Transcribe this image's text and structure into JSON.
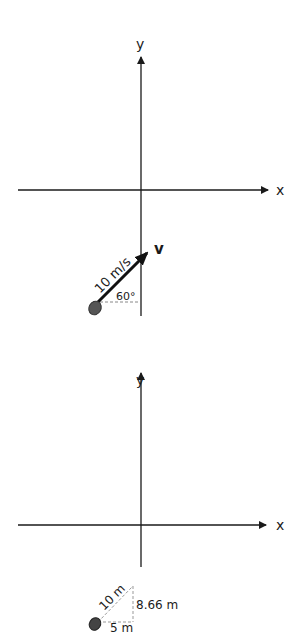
{
  "panel_top": {
    "axes": {
      "x_label": "x",
      "y_label": "y"
    },
    "vector": {
      "symbol": "v",
      "magnitude_label": "10 m/s",
      "angle_label": "60°",
      "angle_deg": 60
    },
    "object": "ball-icon"
  },
  "panel_bottom": {
    "axes": {
      "x_label": "x",
      "y_label": "y"
    },
    "displacement": {
      "hypotenuse_label": "10 m",
      "vertical_label": "8.66 m",
      "horizontal_label": "5 m"
    },
    "object": "ball-icon"
  },
  "colors": {
    "axis": "#1a1a1a",
    "vector": "#111111",
    "dashed": "#888888",
    "ball": "#555555"
  }
}
